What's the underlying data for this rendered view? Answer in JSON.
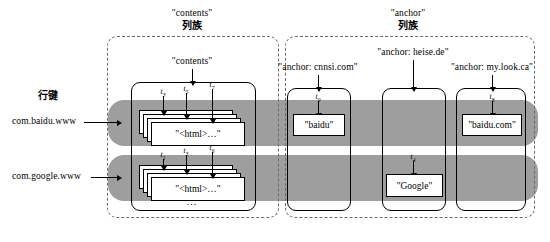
{
  "figure": {
    "row_key_label": "行键",
    "ellipsis": "...",
    "column_families": [
      {
        "id": "contents",
        "title_quoted": "\"contents\"",
        "title_cn": "列族",
        "qualifiers": [
          {
            "label": "\"contents\""
          }
        ]
      },
      {
        "id": "anchor",
        "title_quoted": "\"anchor\"",
        "title_cn": "列族",
        "qualifiers": [
          {
            "label": "\"anchor: cnnsi.com\""
          },
          {
            "label": "\"anchor: heise.de\""
          },
          {
            "label": "\"anchor: my.look.ca\""
          }
        ]
      }
    ],
    "rows": [
      {
        "key": "com.baidu.www"
      },
      {
        "key": "com.google.www"
      }
    ],
    "cells": [
      {
        "row": "com.baidu.www",
        "column": "contents",
        "value": "\"<html>…\"",
        "timestamps": [
          "t3",
          "t5",
          "t7"
        ],
        "stacked": true
      },
      {
        "row": "com.baidu.www",
        "column": "anchor: cnnsi.com",
        "value": "\"baidu\"",
        "timestamps": [
          "t9"
        ],
        "stacked": false
      },
      {
        "row": "com.baidu.www",
        "column": "anchor: my.look.ca",
        "value": "\"baidu.com\"",
        "timestamps": [
          "t8"
        ],
        "stacked": false
      },
      {
        "row": "com.google.www",
        "column": "contents",
        "value": "\"<html>…\"",
        "timestamps": [
          "t1",
          "t3",
          "t6"
        ],
        "stacked": true
      },
      {
        "row": "com.google.www",
        "column": "anchor: heise.de",
        "value": "\"Google\"",
        "timestamps": [
          "t4"
        ],
        "stacked": false
      }
    ],
    "timestamp_labels": {
      "contents_row1": [
        "t",
        "t",
        "t"
      ],
      "contents_row1_subs": [
        "3",
        "5",
        "7"
      ],
      "contents_row2": [
        "t",
        "t",
        "t"
      ],
      "contents_row2_subs": [
        "1",
        "3",
        "6"
      ],
      "baidu": {
        "t": "t",
        "sub": "9"
      },
      "baiducom": {
        "t": "t",
        "sub": "8"
      },
      "google": {
        "t": "t",
        "sub": "4"
      }
    },
    "colors": {
      "row_band": "#9e9e9e",
      "outline": "#000000",
      "dashed": "#6b6b6b",
      "background": "#ffffff"
    }
  }
}
